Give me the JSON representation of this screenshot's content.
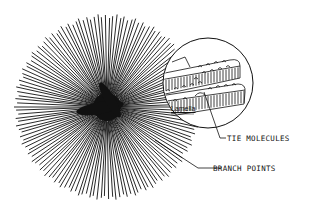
{
  "diagram": {
    "labels": {
      "lamella": "Lamella",
      "tie_molecules": "TIE MOLECULES",
      "branch_points": "BRANCH POINTS"
    },
    "spherulite": {
      "cx": 107,
      "cy": 107,
      "r": 93,
      "ray_count": 150
    },
    "inset": {
      "cx": 208,
      "cy": 83,
      "r": 45
    },
    "colors": {
      "ink": "#111111",
      "background": "#ffffff"
    }
  }
}
